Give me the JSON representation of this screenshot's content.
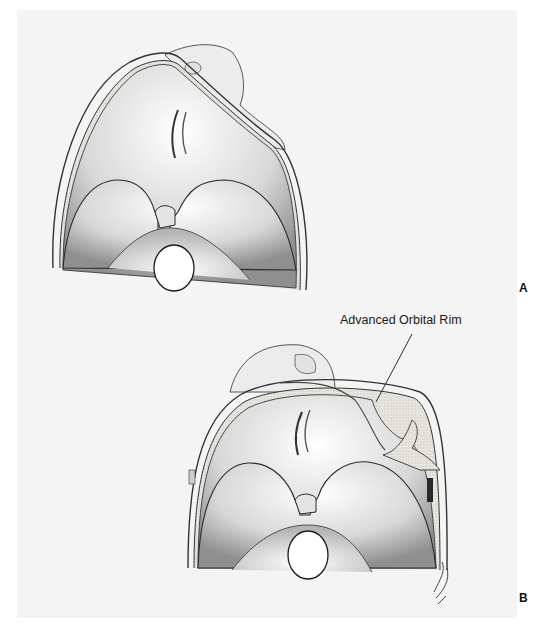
{
  "figure": {
    "panels": [
      {
        "label": "A"
      },
      {
        "label": "B"
      }
    ],
    "callout": {
      "text": "Advanced Orbital Rim"
    },
    "signature": "RO",
    "colors": {
      "background": "#f4f4f4",
      "line": "#2a2a2a",
      "shade": "#8a8a8a"
    }
  }
}
